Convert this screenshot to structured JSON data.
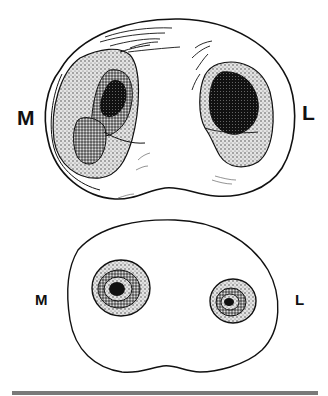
{
  "figure": {
    "top_section": {
      "left_label": "M",
      "right_label": "L"
    },
    "bottom_section": {
      "left_label": "M",
      "right_label": "L"
    }
  },
  "colors": {
    "outline": "#111111",
    "stipple_light": "#bdbdbd",
    "stipple_medium": "#7d7d7d",
    "core_dark": "#111111",
    "bar": "#7a7a7a"
  }
}
